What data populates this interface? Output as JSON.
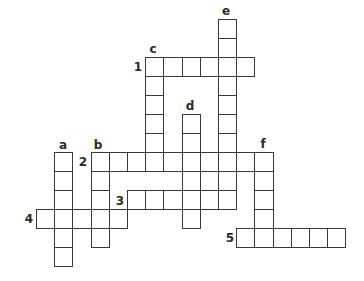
{
  "puzzle": {
    "type": "crossword",
    "grid_origin": {
      "x": 36,
      "y": 19
    },
    "cell_w": 18.2,
    "cell_h": 19,
    "line_color": "#3a3a3a",
    "words": [
      {
        "id": "1",
        "dir": "across",
        "row": 2,
        "col": 6,
        "len": 6
      },
      {
        "id": "2",
        "dir": "across",
        "row": 7,
        "col": 3,
        "len": 10
      },
      {
        "id": "3",
        "dir": "across",
        "row": 9,
        "col": 5,
        "len": 6
      },
      {
        "id": "4",
        "dir": "across",
        "row": 10,
        "col": 0,
        "len": 5
      },
      {
        "id": "5",
        "dir": "across",
        "row": 11,
        "col": 11,
        "len": 6
      },
      {
        "id": "a",
        "dir": "down",
        "row": 7,
        "col": 1,
        "len": 6
      },
      {
        "id": "b",
        "dir": "down",
        "row": 7,
        "col": 3,
        "len": 5
      },
      {
        "id": "c",
        "dir": "down",
        "row": 2,
        "col": 6,
        "len": 6
      },
      {
        "id": "d",
        "dir": "down",
        "row": 5,
        "col": 8,
        "len": 6
      },
      {
        "id": "e",
        "dir": "down",
        "row": 0,
        "col": 10,
        "len": 10
      },
      {
        "id": "f",
        "dir": "down",
        "row": 7,
        "col": 12,
        "len": 5
      }
    ],
    "labels": [
      {
        "text": "1",
        "x": 138,
        "y": 67
      },
      {
        "text": "2",
        "x": 83,
        "y": 162
      },
      {
        "text": "3",
        "x": 120,
        "y": 201
      },
      {
        "text": "4",
        "x": 29,
        "y": 219
      },
      {
        "text": "5",
        "x": 230,
        "y": 238
      },
      {
        "text": "a",
        "x": 63,
        "y": 145
      },
      {
        "text": "b",
        "x": 98,
        "y": 145
      },
      {
        "text": "c",
        "x": 153,
        "y": 49
      },
      {
        "text": "d",
        "x": 190,
        "y": 106
      },
      {
        "text": "e",
        "x": 226,
        "y": 11
      },
      {
        "text": "f",
        "x": 263,
        "y": 144
      }
    ]
  }
}
